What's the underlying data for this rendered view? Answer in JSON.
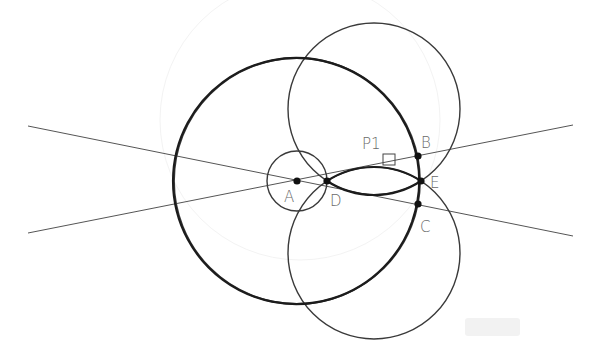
{
  "diagram": {
    "type": "geometric-construction",
    "points": [
      {
        "id": "A",
        "label": "A",
        "x": 297,
        "y": 181
      },
      {
        "id": "D",
        "label": "D",
        "x": 327,
        "y": 181
      },
      {
        "id": "B",
        "label": "B",
        "x": 418,
        "y": 156
      },
      {
        "id": "E",
        "label": "E",
        "x": 421,
        "y": 181
      },
      {
        "id": "C",
        "label": "C",
        "x": 418,
        "y": 204
      }
    ],
    "marker": {
      "label": "P1",
      "x": 383,
      "y": 154,
      "size": 12
    },
    "circles": [
      {
        "name": "small-circle-A",
        "cx": 297,
        "cy": 181,
        "r": 30
      },
      {
        "name": "large-circle-A",
        "cx": 297,
        "cy": 181,
        "r": 123
      },
      {
        "name": "upper-circle",
        "cx": 374,
        "cy": 109,
        "r": 86
      },
      {
        "name": "lower-circle",
        "cx": 374,
        "cy": 253,
        "r": 86
      }
    ],
    "lines": [
      {
        "name": "line-A-B",
        "x1": 28,
        "y1": 233,
        "x2": 573,
        "y2": 125
      },
      {
        "name": "line-A-C",
        "x1": 28,
        "y1": 126,
        "x2": 573,
        "y2": 236
      }
    ],
    "colors": {
      "stroke": "#1c1c1c",
      "label": "#6a6a6a",
      "background": "#ffffff"
    }
  },
  "labels": {
    "A": "A",
    "B": "B",
    "C": "C",
    "D": "D",
    "E": "E",
    "P1": "P1"
  }
}
